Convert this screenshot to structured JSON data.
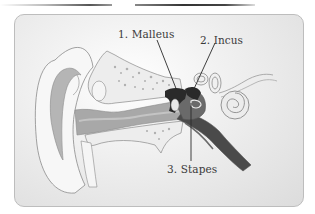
{
  "diagram": {
    "labels": [
      {
        "id": "malleus",
        "text": "1. Malleus"
      },
      {
        "id": "incus",
        "text": "2. Incus"
      },
      {
        "id": "stapes",
        "text": "3. Stapes"
      }
    ],
    "colors": {
      "card_background": "#e6e6e6",
      "ossicle_dark": "#2a2a2a",
      "canal_gray": "#a8a8a8",
      "outline": "#8a8a8a",
      "label_text": "#3a3a3a"
    }
  }
}
